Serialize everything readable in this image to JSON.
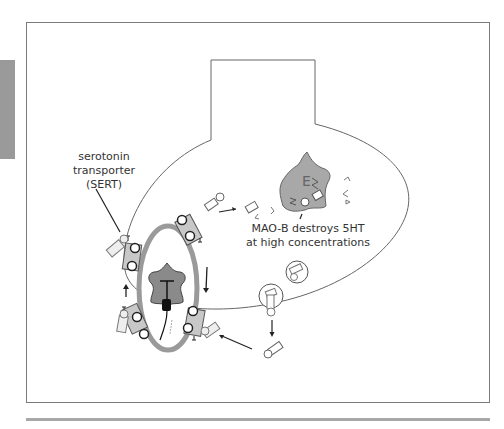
{
  "figure": {
    "labels": {
      "sert_line1": "serotonin",
      "sert_line2": "transporter",
      "sert_line3": "(SERT)",
      "mao_line1": "MAO-B destroys 5HT",
      "mao_line2": "at high concentrations",
      "enzyme_letter": "E"
    },
    "colors": {
      "frame": "#7a7a7a",
      "membrane_ring": "#9a9a9a",
      "receptor_fill": "#8a8a8a",
      "enzyme_fill": "#a8a8a8",
      "side_tab": "#9a9a9a"
    }
  }
}
